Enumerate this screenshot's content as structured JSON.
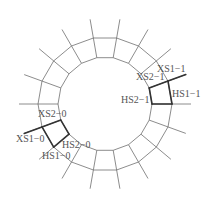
{
  "diagram": {
    "type": "ring-segment-diagram",
    "center": [
      105,
      104
    ],
    "inner_radius": 47,
    "outer_radius": 67,
    "spoke_radius": 86,
    "spoke_count": 18,
    "spoke_start_angle_deg": 10,
    "spoke_step_deg": 20,
    "colors": {
      "thin_line": "#6e6e6e",
      "bold_line": "#333333",
      "label": "#555555"
    },
    "highlighted_segments": [
      {
        "name": "segment-1",
        "from_deg": 70,
        "to_deg": 90,
        "bold_spoke_deg": 70
      },
      {
        "name": "segment-0",
        "from_deg": 230,
        "to_deg": 250,
        "bold_spoke_deg": 250
      }
    ],
    "labels": [
      {
        "id": "xs1-1",
        "text": "XS1−1",
        "x": 157,
        "y": 72
      },
      {
        "id": "xs2-1",
        "text": "XS2−1",
        "x": 136,
        "y": 80
      },
      {
        "id": "hs2-1",
        "text": "HS2−1",
        "x": 121,
        "y": 103
      },
      {
        "id": "hs1-1",
        "text": "HS1−1",
        "x": 172,
        "y": 97
      },
      {
        "id": "xs2-0",
        "text": "XS2−0",
        "x": 38,
        "y": 117
      },
      {
        "id": "xs1-0",
        "text": "XS1−0",
        "x": 16,
        "y": 142
      },
      {
        "id": "hs2-0",
        "text": "HS2−0",
        "x": 62,
        "y": 148
      },
      {
        "id": "hs1-0",
        "text": "HS1−0",
        "x": 42,
        "y": 159
      }
    ]
  }
}
